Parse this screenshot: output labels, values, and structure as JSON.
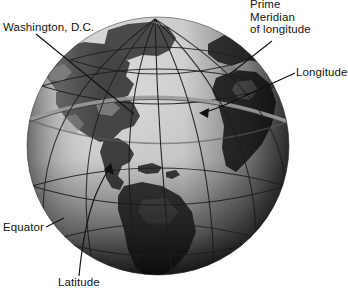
{
  "figure": {
    "type": "labeled-diagram"
  },
  "labels": {
    "washington": "Washington, D.C.",
    "prime_meridian": [
      "Prime",
      "Meridian",
      "of longitude"
    ],
    "longitude": "Longitude",
    "equator": "Equator",
    "latitude": "Latitude"
  },
  "colors": {
    "ocean_light": "#dcdcdc",
    "ocean_mid": "#b4b4b4",
    "land_dark": "#4f4f4f",
    "land_shadow": "#2a2a2a",
    "limb_shadow": "#1a1a1a",
    "graticule": "#1b1b1b",
    "highlight_arc": "#9a9a9a",
    "leader": "#111111",
    "text": "#141414",
    "background": "#ffffff"
  },
  "globe": {
    "center_x": 158,
    "center_y": 146,
    "radius": 131,
    "pole_x": 155,
    "pole_y": 19,
    "meridian_count": 7,
    "parallel_count": 5
  }
}
